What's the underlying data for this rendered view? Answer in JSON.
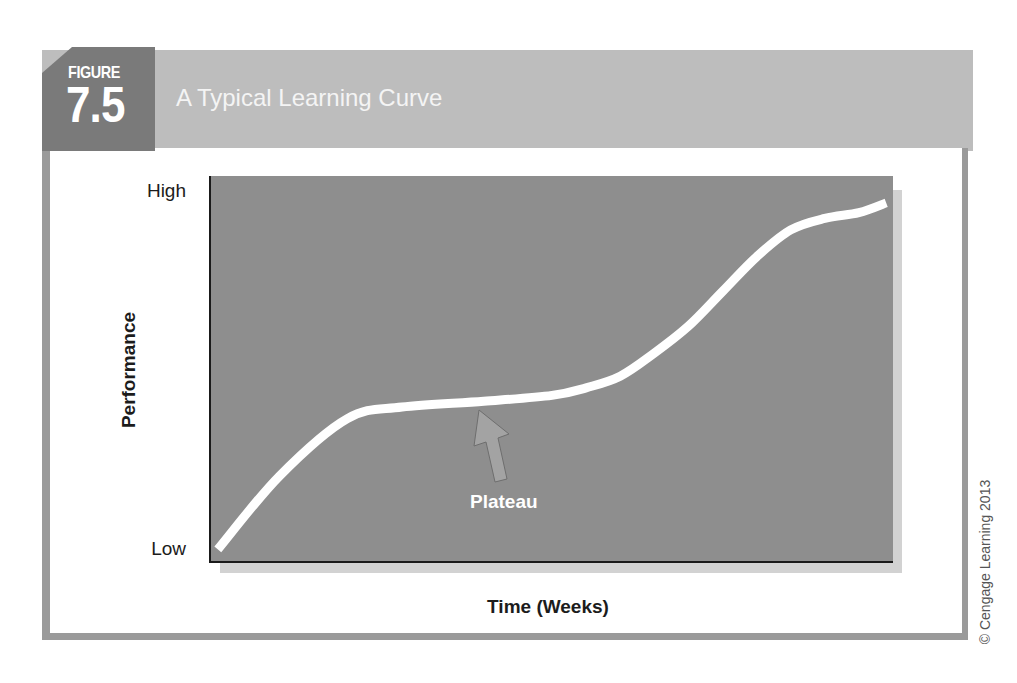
{
  "figure": {
    "label": "FIGURE",
    "number": "7.5",
    "title": "A Typical Learning Curve",
    "credit": "© Cengage Learning 2013"
  },
  "colors": {
    "badge": "#7a7a7a",
    "title_band": "#bdbdbd",
    "frame_border": "#9a9a9a",
    "plot_background": "#8e8e8e",
    "plot_shadow": "#d2d2d2",
    "curve": "#ffffff",
    "arrow": "#a3a3a3"
  },
  "chart_data": {
    "type": "line",
    "title": "A Typical Learning Curve",
    "xlabel": "Time (Weeks)",
    "ylabel": "Performance",
    "y_tick_labels": [
      "Low",
      "High"
    ],
    "x_tick_labels": [],
    "xlim": [
      0,
      100
    ],
    "ylim": [
      0,
      100
    ],
    "grid": false,
    "legend": null,
    "series": [
      {
        "name": "Learning curve",
        "x": [
          1,
          10,
          20,
          28,
          40,
          50,
          55,
          60,
          65,
          70,
          75,
          80,
          85,
          90,
          95,
          99
        ],
        "y": [
          3,
          22,
          37,
          40,
          41.5,
          43,
          45,
          48,
          54,
          61,
          70,
          79,
          86,
          89,
          90.5,
          93
        ]
      }
    ],
    "annotations": [
      {
        "text": "Plateau",
        "arrow_target_x": 40,
        "arrow_target_y": 40
      }
    ]
  },
  "axis": {
    "y_high": "High",
    "y_low": "Low",
    "y_label": "Performance",
    "x_label": "Time (Weeks)"
  },
  "annotation": {
    "text": "Plateau"
  }
}
